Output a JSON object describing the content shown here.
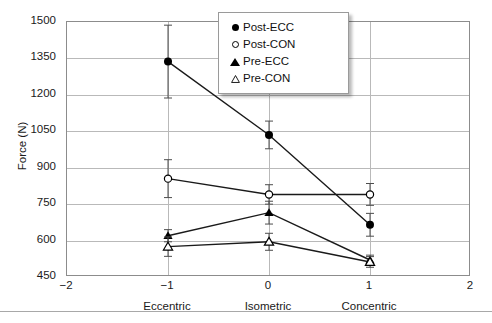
{
  "chart_data": {
    "type": "line",
    "title": "",
    "xlabel": "",
    "ylabel": "Force (N)",
    "xlim": [
      -2,
      2
    ],
    "ylim": [
      450,
      1500
    ],
    "ytick_values": [
      1500,
      1350,
      1200,
      1050,
      900,
      750,
      600,
      450
    ],
    "xtick_values": [
      -2,
      -1,
      0,
      1,
      2
    ],
    "xtick_labels": [
      "−2",
      "−1",
      "0",
      "1",
      "2"
    ],
    "category_labels": [
      {
        "x": -1,
        "label": "Eccentric"
      },
      {
        "x": 0,
        "label": "Isometric"
      },
      {
        "x": 1,
        "label": "Concentric"
      }
    ],
    "grid": "horizontal-and-vertical",
    "legend_position": "top-right",
    "x": [
      -1,
      0,
      1
    ],
    "series": [
      {
        "name": "Post-ECC",
        "marker": "filled-circle",
        "values": [
          1337,
          1035,
          665
        ],
        "errors": [
          150,
          57,
          47
        ]
      },
      {
        "name": "Post-CON",
        "marker": "open-circle",
        "values": [
          855,
          790,
          790
        ],
        "errors": [
          78,
          40,
          45
        ]
      },
      {
        "name": "Pre-ECC",
        "marker": "filled-triangle",
        "values": [
          620,
          715,
          520
        ],
        "errors": [
          25,
          47,
          20
        ]
      },
      {
        "name": "Pre-CON",
        "marker": "open-triangle",
        "values": [
          575,
          595,
          512
        ],
        "errors": [
          40,
          35,
          22
        ]
      }
    ]
  },
  "colors": {
    "line": "#1a1a1a",
    "grid": "#b9b9b9",
    "frame": "#8c8c8c",
    "text": "#1a1a1a",
    "background": "#ffffff"
  },
  "legend": {
    "entries": [
      {
        "label": "Post-ECC",
        "marker": "filled-circle"
      },
      {
        "label": "Post-CON",
        "marker": "open-circle"
      },
      {
        "label": "Pre-ECC",
        "marker": "filled-triangle"
      },
      {
        "label": "Pre-CON",
        "marker": "open-triangle"
      }
    ]
  }
}
